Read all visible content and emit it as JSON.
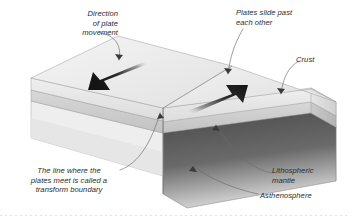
{
  "diagram": {
    "background_color": "#ffffff",
    "labels": {
      "direction_of_plate_movement": "Direction\nof plate\nmovement",
      "plates_slide_past": "Plates slide past\neach other",
      "crust": "Crust",
      "transform_boundary": "The line where the\nplates meet is called a\ntransform boundary",
      "lithospheric_mantle": "Lithospheric\nmantle",
      "asthenosphere": "Asthenosphere"
    },
    "layers": [
      {
        "name": "Crust",
        "color": "#ededed",
        "description": "light gray top slab"
      },
      {
        "name": "Lithospheric mantle",
        "color": "#d2d2d2",
        "description": "medium gray middle band"
      },
      {
        "name": "Asthenosphere",
        "color": "#4b4b4b",
        "description": "dark gray lower block"
      }
    ],
    "arrows": [
      {
        "name": "left-plate-arrow",
        "direction": "down-left",
        "color": "#1a1a1a"
      },
      {
        "name": "right-plate-arrow",
        "direction": "up-right",
        "color": "#1a1a1a"
      }
    ],
    "line_color": "#555555",
    "text_color": "#2b2b2b"
  }
}
